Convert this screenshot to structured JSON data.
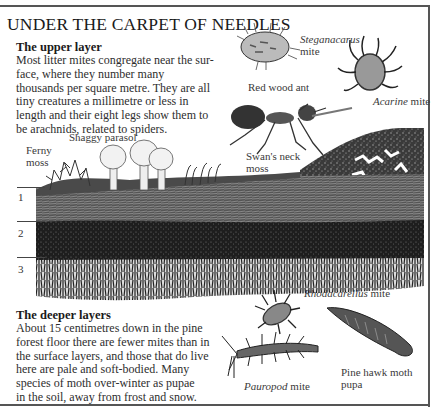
{
  "page": {
    "title": "UNDER THE CARPET OF NEEDLES"
  },
  "upper_layer": {
    "heading": "The upper layer",
    "lines": [
      "Most litter mites congregate near the sur-",
      "face, where they number many",
      "thousands per square metre. They are all",
      "tiny creatures a millimetre or less in",
      "length and their eight legs show them to",
      "be arachnids, related to spiders."
    ]
  },
  "deeper_layers": {
    "heading": "The deeper layers",
    "lines": [
      "About 15 centimetres down in the pine",
      "forest floor there are fewer mites than in",
      "the surface layers, and those that do live",
      "here are pale and soft-bodied. Many",
      "species of moth over-winter as pupae",
      "in the soil, away from frost and snow."
    ]
  },
  "labels": {
    "steganacarus": {
      "name": "Steganacarus",
      "suffix": "mite"
    },
    "acarine": {
      "name": "Acarine",
      "suffix": "mite"
    },
    "red_wood_ant": "Red wood ant",
    "swans_neck_moss": [
      "Swan's neck",
      "moss"
    ],
    "shaggy_parasol": "Shaggy parasol",
    "ferny_moss": [
      "Ferny",
      "moss"
    ],
    "rhodacarellus": {
      "name": "Rhodacarellus",
      "suffix": "mite"
    },
    "pauropod": {
      "name": "Pauropod",
      "suffix": "mite"
    },
    "pine_hawk_moth": [
      "Pine hawk moth",
      "pupa"
    ]
  },
  "layers": [
    "1",
    "2",
    "3"
  ],
  "colors": {
    "ink": "#1a1a1a",
    "soil_dark": "#222222",
    "soil_mid": "#555555",
    "paper": "#ffffff"
  }
}
